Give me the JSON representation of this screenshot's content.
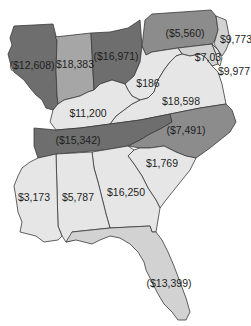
{
  "map": {
    "region": "Eastern United States",
    "colors": {
      "dark": "#6e6e6e",
      "medium_dark": "#8c8c8c",
      "medium": "#a6a6a6",
      "light": "#d2d2d2",
      "lighter": "#e6e6e6",
      "border": "#3a3a3a",
      "background": "#ffffff"
    },
    "states": [
      {
        "name": "Illinois",
        "value": "($12,608)"
      },
      {
        "name": "Indiana",
        "value": "$18,383"
      },
      {
        "name": "Ohio",
        "value": "($16,971)"
      },
      {
        "name": "Pennsylvania",
        "value": "($5,560)"
      },
      {
        "name": "New Jersey",
        "value": "$9,773"
      },
      {
        "name": "Maryland",
        "value": "$7,03"
      },
      {
        "name": "Delaware",
        "value": "$9,977"
      },
      {
        "name": "West Virginia",
        "value": "$186"
      },
      {
        "name": "Virginia",
        "value": "$18,598"
      },
      {
        "name": "Kentucky",
        "value": "$11,200"
      },
      {
        "name": "Tennessee",
        "value": "($15,342)"
      },
      {
        "name": "North Carolina",
        "value": "($7,491)"
      },
      {
        "name": "South Carolina",
        "value": "$1,769"
      },
      {
        "name": "Georgia",
        "value": "$16,250"
      },
      {
        "name": "Alabama",
        "value": "$5,787"
      },
      {
        "name": "Mississippi",
        "value": "$3,173"
      },
      {
        "name": "Florida",
        "value": "($13,399)"
      }
    ]
  }
}
